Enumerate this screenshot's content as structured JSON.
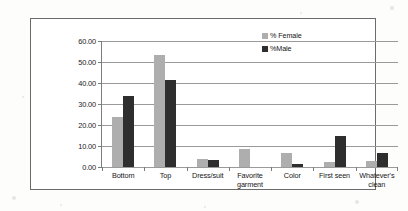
{
  "chart_data": {
    "type": "bar",
    "title": "",
    "xlabel": "",
    "ylabel": "Percent of Respondents",
    "ylim": [
      0,
      60
    ],
    "ytick_step": 10,
    "ytick_labels": [
      "60.00",
      "50.00",
      "40.00",
      "30.00",
      "20.00",
      "10.00",
      "0.00"
    ],
    "grid": true,
    "legend_position": "top-right-inside",
    "categories": [
      "Bottom",
      "Top",
      "Dress/suit",
      "Favorite garment",
      "Color",
      "First seen",
      "Whatever's clean"
    ],
    "series": [
      {
        "name": "% Female",
        "color": "#aeaeae",
        "values": [
          24.0,
          53.5,
          4.0,
          8.5,
          6.5,
          2.5,
          3.0
        ]
      },
      {
        "name": "%Male",
        "color": "#2e2e2e",
        "values": [
          34.0,
          41.5,
          3.5,
          0.0,
          1.5,
          15.0,
          6.5
        ]
      }
    ]
  },
  "legend": {
    "items": [
      {
        "label": "% Female",
        "swatch": "female-swatch"
      },
      {
        "label": "%Male",
        "swatch": "male-swatch"
      }
    ]
  },
  "axis": {
    "y_title": "Percent of Respondents"
  }
}
